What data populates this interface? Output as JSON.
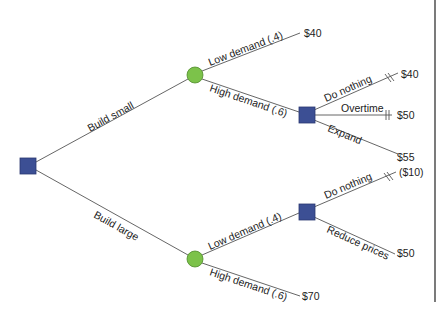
{
  "colors": {
    "decision_node": "#3c4f94",
    "chance_node": "#7cc24a",
    "line": "#555555",
    "border": "#333333"
  },
  "diagram": {
    "type": "decision-tree",
    "nodes": {
      "root": {
        "kind": "decision",
        "shape": "square"
      },
      "chance_small": {
        "kind": "chance",
        "shape": "circle"
      },
      "decision_small_high": {
        "kind": "decision",
        "shape": "square"
      },
      "chance_large": {
        "kind": "chance",
        "shape": "circle"
      },
      "decision_large_low": {
        "kind": "decision",
        "shape": "square"
      }
    },
    "branches": {
      "build_small": "Build small",
      "build_large": "Build large",
      "small_low": "Low demand (.4)",
      "small_high": "High demand (.6)",
      "small_high_nothing": "Do nothing",
      "small_high_overtime": "Overtime",
      "small_high_expand": "Expand",
      "large_low": "Low demand (.4)",
      "large_high": "High demand (.6)",
      "large_low_nothing": "Do nothing",
      "large_low_reduce": "Reduce prices"
    },
    "payoffs": {
      "small_low": "$40",
      "small_high_nothing": "$40",
      "small_high_overtime": "$50",
      "small_high_expand": "$55",
      "large_low_nothing": "($10)",
      "large_low_reduce": "$50",
      "large_high": "$70"
    }
  }
}
